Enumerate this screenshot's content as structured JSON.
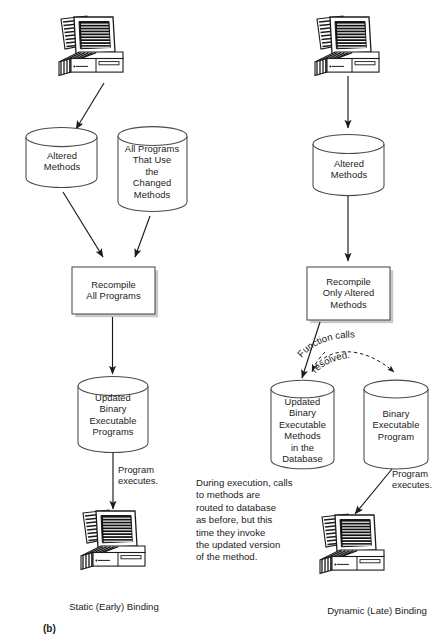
{
  "figure": {
    "label": "(b)",
    "background": "#ffffff",
    "ink": "#1b1b1b",
    "outline": "#4a4a4a"
  },
  "panels": [
    {
      "id": "static",
      "caption": "Static (Early) Binding",
      "nodes": {
        "source_computer": "computer-icon",
        "cyl_altered_methods": "Altered\nMethods",
        "cyl_all_programs": "All Programs\nThat Use\nthe\nChanged\nMethods",
        "box_recompile": "Recompile\nAll Programs",
        "cyl_updated_binary": "Updated\nBinary\nExecutable\nPrograms",
        "target_computer": "computer-icon"
      },
      "edge_labels": {
        "program_executes": "Program\nexecutes."
      }
    },
    {
      "id": "dynamic",
      "caption": "Dynamic (Late) Binding",
      "nodes": {
        "source_computer": "computer-icon",
        "cyl_altered_methods": "Altered\nMethods",
        "box_recompile": "Recompile\nOnly Altered\nMethods",
        "cyl_updated_methods_db": "Updated\nBinary\nExecutable\nMethods\nin the\nDatabase",
        "cyl_binary_exec_program": "Binary\nExecutable\nProgram",
        "target_computer": "computer-icon"
      },
      "edge_labels": {
        "function_calls_resolved_line1": "Function calls",
        "function_calls_resolved_line2": "resolved.",
        "program_executes": "Program\nexecutes."
      },
      "note": "During execution, calls\nto methods are\nrouted to database\nas before, but this\ntime they invoke\nthe updated version\nof the method."
    }
  ]
}
